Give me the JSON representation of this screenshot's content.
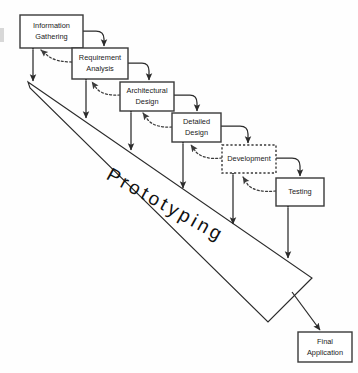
{
  "diagram": {
    "type": "process-flow-diagram",
    "background_color": "#fefefe",
    "stroke_color": "#2b2b2b",
    "wedge": {
      "label": "Prototyping",
      "rotation_degrees": 29,
      "apex": {
        "x": 28,
        "y": 82
      },
      "tip": {
        "x": 312,
        "y": 278
      },
      "fill_color": "#ffffff"
    },
    "stages": [
      {
        "id": "information-gathering",
        "label_line1": "Information",
        "label_line2": "Gathering",
        "border_style": "solid",
        "x": 20,
        "y": 15,
        "w": 63,
        "h": 33
      },
      {
        "id": "requirement-analysis",
        "label_line1": "Requirement",
        "label_line2": "Analysis",
        "border_style": "solid",
        "x": 72,
        "y": 48,
        "w": 56,
        "h": 31
      },
      {
        "id": "architectural-design",
        "label_line1": "Architectural",
        "label_line2": "Design",
        "border_style": "solid",
        "x": 120,
        "y": 82,
        "w": 54,
        "h": 29
      },
      {
        "id": "detailed-design",
        "label_line1": "Detailed",
        "label_line2": "Design",
        "border_style": "solid",
        "x": 172,
        "y": 113,
        "w": 49,
        "h": 29
      },
      {
        "id": "development",
        "label_line1": "Development",
        "label_line2": "",
        "border_style": "dotted",
        "x": 222,
        "y": 145,
        "w": 54,
        "h": 28
      },
      {
        "id": "testing",
        "label_line1": "Testing",
        "label_line2": "",
        "border_style": "solid",
        "x": 276,
        "y": 178,
        "w": 48,
        "h": 28
      },
      {
        "id": "final-application",
        "label_line1": "Final",
        "label_line2": "Application",
        "border_style": "solid",
        "x": 298,
        "y": 332,
        "w": 54,
        "h": 30
      }
    ],
    "connections": {
      "forward_label": "sequential flow",
      "feedback_label": "feedback loop",
      "prototype_label": "prototype iteration"
    }
  }
}
